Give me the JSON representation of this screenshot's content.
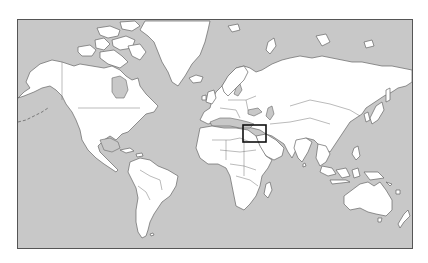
{
  "map": {
    "projection": "mercator-world",
    "colors": {
      "ocean": "#c8c8c8",
      "land": "#ffffff",
      "outline": "#666666",
      "highlight": "#111111"
    },
    "frame": {
      "x": 17,
      "y": 19,
      "width": 396,
      "height": 230
    },
    "highlight_box": {
      "region": "Eastern Mediterranean / Levant & Egypt",
      "x": 243,
      "y": 125,
      "width": 23,
      "height": 17
    },
    "continents": [
      "North America",
      "Greenland",
      "South America",
      "Europe",
      "Africa",
      "Asia",
      "Australia",
      "New Zealand",
      "Antarctica-free"
    ]
  }
}
